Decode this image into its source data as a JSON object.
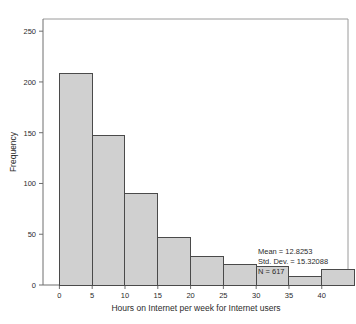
{
  "chart_data": {
    "type": "bar",
    "title": "",
    "subtitle": "",
    "xlabel": "Hours on Internet per week for Internet users",
    "ylabel": "Frequency",
    "categories": [
      "0-5",
      "5-10",
      "10-15",
      "15-20",
      "20-25",
      "25-30",
      "30-35",
      "35-40",
      "40-45"
    ],
    "bin_starts": [
      0,
      5,
      10,
      15,
      20,
      25,
      30,
      35,
      40
    ],
    "bin_width": 5,
    "values": [
      208,
      147,
      90,
      47,
      28,
      20,
      18,
      8,
      15
    ],
    "xlim": [
      -2.5,
      44
    ],
    "ylim": [
      0,
      262
    ],
    "xticks": [
      0,
      5,
      10,
      15,
      20,
      25,
      30,
      35,
      40
    ],
    "xtick_labels": [
      "0",
      "5",
      "10",
      "15",
      "20",
      "25",
      "30",
      "35",
      "40"
    ],
    "yticks": [
      0,
      50,
      100,
      150,
      200,
      250
    ],
    "ytick_labels": [
      "0",
      "50",
      "100",
      "150",
      "200",
      "250"
    ],
    "grid": false,
    "legend": null,
    "bar_fill": "#d0d0d0",
    "bar_edge": "#4a4a4a",
    "axis_color": "#808080",
    "annotations": [
      "Mean = 12.8253",
      "Std. Dev. = 15.32088",
      "N = 617"
    ],
    "annotation_position": "inside-right"
  },
  "stats": {
    "mean_line": "Mean = 12.8253",
    "stddev_line": "Std. Dev. = 15.32088",
    "n_line": "N = 617"
  },
  "axes": {
    "y_title": "Frequency",
    "x_title": "Hours on Internet per week for Internet users"
  }
}
